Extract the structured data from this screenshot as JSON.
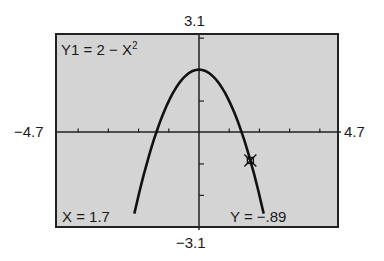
{
  "chart_data": {
    "type": "line",
    "equation_label": "Y1 = 2 − X",
    "equation_exponent": "2",
    "function": "y = 2 - x^2",
    "xlim": [
      -4.7,
      4.7
    ],
    "ylim": [
      -3.1,
      3.1
    ],
    "xscale": 1,
    "yscale": 1,
    "x_tick_labels": {
      "min": "−4.7",
      "max": "4.7"
    },
    "y_tick_labels": {
      "min": "−3.1",
      "max": "3.1"
    },
    "series": [
      {
        "name": "Y1",
        "x": [
          -2.3,
          -2,
          -1.5,
          -1,
          -0.5,
          0,
          0.5,
          1,
          1.5,
          2,
          2.3
        ],
        "y": [
          -3.29,
          -2,
          -0.25,
          1,
          1.75,
          2,
          1.75,
          1,
          -0.25,
          -2,
          -3.29
        ]
      }
    ],
    "trace_cursor": {
      "x": 1.7,
      "y": -0.89
    },
    "grid": false,
    "legend": null
  },
  "labels": {
    "ymax": "3.1",
    "ymin": "−3.1",
    "xmin": "−4.7",
    "xmax": "4.7",
    "equation": "Y1 = 2 − X",
    "equation_exp": "2",
    "x_readout": "X = 1.7",
    "y_readout": "Y = −.89"
  },
  "colors": {
    "screen_bg": "#d4d4d4",
    "ink": "#1a1a1a"
  }
}
